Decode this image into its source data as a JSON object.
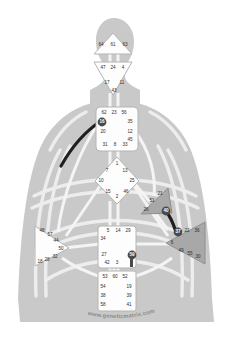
{
  "brand": {
    "text": "www.geneticmatrix.com"
  },
  "colors": {
    "body_silhouette": "#c9c9c9",
    "channel_undefined": "#f2f2f2",
    "center_undefined_fill": "#fdfdfd",
    "center_defined_fill": "#a8a8a8",
    "center_stroke": "#8f8f8f",
    "gate_text": "#2e2e2e",
    "gate_highlight_fill": "#4a4a4a",
    "channel_defined": "#1f1f1f",
    "brand_text": "#8a8a8a",
    "background": "#ffffff"
  },
  "centers": [
    {
      "id": "head",
      "name": "Head",
      "shape": "triangle-up",
      "state": "undefined",
      "gates": [
        "64",
        "61",
        "63"
      ]
    },
    {
      "id": "ajna",
      "name": "Ajna",
      "shape": "triangle-down",
      "state": "undefined",
      "gates": [
        "47",
        "24",
        "4",
        "17",
        "11",
        "43"
      ]
    },
    {
      "id": "throat",
      "name": "Throat",
      "shape": "square",
      "state": "undefined",
      "gates": [
        "62",
        "23",
        "56",
        "16",
        "35",
        "20",
        "12",
        "31",
        "8",
        "33",
        "45"
      ]
    },
    {
      "id": "g-center",
      "name": "G Center",
      "shape": "diamond",
      "state": "undefined",
      "gates": [
        "1",
        "7",
        "13",
        "10",
        "25",
        "15",
        "46",
        "2"
      ]
    },
    {
      "id": "heart",
      "name": "Heart / Ego",
      "shape": "triangle-left",
      "state": "defined",
      "gates": [
        "21",
        "51",
        "26",
        "40"
      ]
    },
    {
      "id": "solar-plexus",
      "name": "Solar Plexus",
      "shape": "triangle-left",
      "state": "defined",
      "gates": [
        "6",
        "37",
        "22",
        "36",
        "49",
        "55",
        "30"
      ]
    },
    {
      "id": "spleen",
      "name": "Spleen",
      "shape": "triangle-right",
      "state": "undefined",
      "gates": [
        "48",
        "57",
        "44",
        "50",
        "32",
        "28",
        "18"
      ]
    },
    {
      "id": "sacral",
      "name": "Sacral",
      "shape": "square",
      "state": "undefined",
      "gates": [
        "5",
        "14",
        "29",
        "34",
        "27",
        "42",
        "3",
        "59"
      ]
    },
    {
      "id": "root",
      "name": "Root",
      "shape": "square",
      "state": "undefined",
      "gates": [
        "53",
        "60",
        "52",
        "54",
        "19",
        "38",
        "39",
        "58",
        "41"
      ]
    }
  ],
  "gate_labels": {
    "head": [
      {
        "t": "64",
        "x": 101,
        "y": 45
      },
      {
        "t": "61",
        "x": 113,
        "y": 45
      },
      {
        "t": "63",
        "x": 125,
        "y": 45
      }
    ],
    "ajna": [
      {
        "t": "47",
        "x": 103,
        "y": 68
      },
      {
        "t": "24",
        "x": 113,
        "y": 68
      },
      {
        "t": "4",
        "x": 123,
        "y": 68
      },
      {
        "t": "17",
        "x": 107,
        "y": 83
      },
      {
        "t": "11",
        "x": 122,
        "y": 83
      },
      {
        "t": "43",
        "x": 114,
        "y": 91
      }
    ],
    "throat": [
      {
        "t": "62",
        "x": 104,
        "y": 113
      },
      {
        "t": "23",
        "x": 114,
        "y": 113
      },
      {
        "t": "56",
        "x": 124,
        "y": 113
      },
      {
        "t": "16",
        "x": 102,
        "y": 122,
        "hl": true
      },
      {
        "t": "35",
        "x": 130,
        "y": 122
      },
      {
        "t": "20",
        "x": 103,
        "y": 132
      },
      {
        "t": "12",
        "x": 130,
        "y": 132
      },
      {
        "t": "45",
        "x": 130,
        "y": 140
      },
      {
        "t": "31",
        "x": 105,
        "y": 145
      },
      {
        "t": "8",
        "x": 115,
        "y": 145
      },
      {
        "t": "33",
        "x": 125,
        "y": 145
      }
    ],
    "g": [
      {
        "t": "1",
        "x": 117,
        "y": 164
      },
      {
        "t": "7",
        "x": 107,
        "y": 171
      },
      {
        "t": "13",
        "x": 125,
        "y": 171
      },
      {
        "t": "10",
        "x": 101,
        "y": 181
      },
      {
        "t": "25",
        "x": 132,
        "y": 181
      },
      {
        "t": "15",
        "x": 108,
        "y": 192
      },
      {
        "t": "46",
        "x": 126,
        "y": 192
      },
      {
        "t": "2",
        "x": 117,
        "y": 197
      }
    ],
    "heart": [
      {
        "t": "21",
        "x": 160,
        "y": 194
      },
      {
        "t": "51",
        "x": 152,
        "y": 201
      },
      {
        "t": "26",
        "x": 146,
        "y": 210
      },
      {
        "t": "40",
        "x": 166,
        "y": 211,
        "hl": true
      }
    ],
    "solar": [
      {
        "t": "37",
        "x": 178,
        "y": 232,
        "hl": true
      },
      {
        "t": "22",
        "x": 187,
        "y": 231
      },
      {
        "t": "36",
        "x": 197,
        "y": 231
      },
      {
        "t": "6",
        "x": 172,
        "y": 243
      },
      {
        "t": "49",
        "x": 181,
        "y": 251
      },
      {
        "t": "55",
        "x": 190,
        "y": 254
      },
      {
        "t": "30",
        "x": 198,
        "y": 257
      }
    ],
    "spleen": [
      {
        "t": "48",
        "x": 42,
        "y": 231
      },
      {
        "t": "57",
        "x": 50,
        "y": 235
      },
      {
        "t": "44",
        "x": 56,
        "y": 241
      },
      {
        "t": "50",
        "x": 61,
        "y": 249
      },
      {
        "t": "32",
        "x": 55,
        "y": 257
      },
      {
        "t": "28",
        "x": 47,
        "y": 260
      },
      {
        "t": "18",
        "x": 40,
        "y": 262
      }
    ],
    "sacral": [
      {
        "t": "5",
        "x": 108,
        "y": 231
      },
      {
        "t": "14",
        "x": 118,
        "y": 231
      },
      {
        "t": "29",
        "x": 128,
        "y": 231
      },
      {
        "t": "34",
        "x": 103,
        "y": 239
      },
      {
        "t": "27",
        "x": 104,
        "y": 255
      },
      {
        "t": "59",
        "x": 132,
        "y": 255,
        "hl": true
      },
      {
        "t": "42",
        "x": 107,
        "y": 263
      },
      {
        "t": "3",
        "x": 117,
        "y": 263
      }
    ],
    "root": [
      {
        "t": "53",
        "x": 105,
        "y": 277
      },
      {
        "t": "60",
        "x": 115,
        "y": 277
      },
      {
        "t": "52",
        "x": 125,
        "y": 277
      },
      {
        "t": "54",
        "x": 103,
        "y": 287
      },
      {
        "t": "19",
        "x": 129,
        "y": 287
      },
      {
        "t": "38",
        "x": 103,
        "y": 296
      },
      {
        "t": "39",
        "x": 129,
        "y": 296
      },
      {
        "t": "58",
        "x": 103,
        "y": 305
      },
      {
        "t": "41",
        "x": 129,
        "y": 305
      }
    ]
  },
  "defined_channels": [
    {
      "name": "16-48 channel (throat to spleen)",
      "gates": [
        "16",
        "48"
      ]
    },
    {
      "name": "40-37 channel (heart to solar plexus)",
      "gates": [
        "40",
        "37"
      ]
    }
  ]
}
